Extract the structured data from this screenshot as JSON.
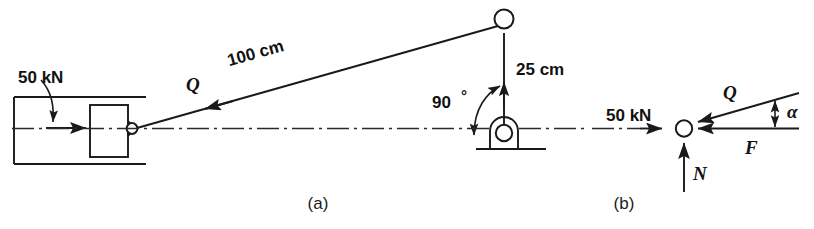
{
  "figure": {
    "type": "engineering-statics-line-diagram",
    "background_color": "#ffffff",
    "ink_color": "#1a1a1a",
    "panels": [
      {
        "id": "a",
        "caption": "(a)",
        "description": "Block in horizontal guide pulled by cable over a vertical post",
        "labels": {
          "applied_load": "50 kN",
          "cable_force": "Q",
          "cable_length": "100 cm",
          "post_height": "25 cm",
          "angle_at_base": "90°"
        }
      },
      {
        "id": "b",
        "caption": "(b)",
        "description": "Free-body diagram of the particle",
        "labels": {
          "applied_load": "50 kN",
          "cable_force": "Q",
          "friction_force": "F",
          "normal_force": "N",
          "angle": "α"
        }
      }
    ],
    "captions": {
      "panel_a": "(a)",
      "panel_b": "(b)"
    },
    "text_items": {
      "load_a": "50 kN",
      "q_a": "Q",
      "length_100": "100 cm",
      "height_25": "25 cm",
      "angle_90": "90",
      "degree_sign": "°",
      "load_b": "50 kN",
      "q_b": "Q",
      "force_f": "F",
      "force_n": "N",
      "angle_alpha": "α"
    }
  }
}
